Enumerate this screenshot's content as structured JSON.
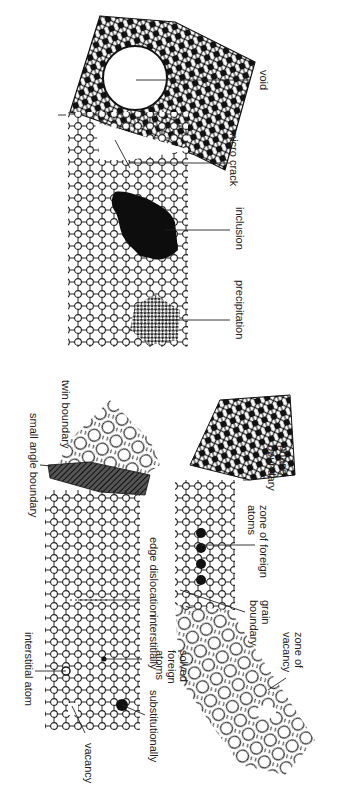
{
  "figure": {
    "orientation": "rotated 90deg clockwise",
    "top_panel": {
      "labels": {
        "void": "void",
        "micro_crack": "micro crack",
        "inclusion": "inclusion",
        "precipitation": "precipitation"
      }
    },
    "bottom_panel": {
      "labels": {
        "small_angle_boundary": "small angle boundary",
        "twin_boundary": "twin boundary",
        "edge_dislocation": "edge dislocation",
        "interstitial_atom": "interstitial atom",
        "vacancy": "vacancy",
        "interstitially": "interstitially",
        "substitutionally": "substitutionally",
        "solved_foreign_atoms": "solved foreign atoms",
        "zone_of_foreign_atoms": "zone of foreign atoms",
        "grain_boundary": "grain boundary",
        "phase_boundary": "phase boundary",
        "zone_of_vacancy": "zone of vacancy"
      }
    },
    "colors": {
      "ink": "#1a1a1a",
      "background": "#ffffff",
      "caption": "#bbbbbb"
    }
  }
}
